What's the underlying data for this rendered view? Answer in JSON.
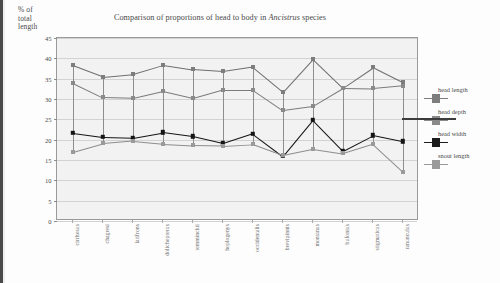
{
  "axis_label": {
    "line1": "% of",
    "line2": "total",
    "line3": "length"
  },
  "chart_data": {
    "type": "line",
    "title": "Comparison of proportions of head to body in Ancistrus species",
    "title_plain": "Comparison of proportions of head to body in ",
    "title_italic": "Ancistrus",
    "title_tail": " species",
    "xlabel": "",
    "ylabel": "% of total length",
    "ylim": [
      0,
      45
    ],
    "yticks": [
      0,
      5,
      10,
      15,
      20,
      25,
      30,
      35,
      40,
      45
    ],
    "grid": true,
    "legend_position": "right",
    "categories": [
      "cirrhosus",
      "chagresi",
      "latifrons",
      "dolichopterus",
      "temminckii",
      "hoplogenys",
      "occidentalis",
      "brevipinnis",
      "montanus",
      "bufonius",
      "stigmaticus",
      "ranunculus"
    ],
    "series": [
      {
        "name": "head length",
        "color": "#7d7d7d",
        "values": [
          38.3,
          35.5,
          36.2,
          38.4,
          37.3,
          36.8,
          37.9,
          31.8,
          39.9,
          32.8,
          37.8,
          34.1
        ]
      },
      {
        "name": "head depth",
        "color": "#8a8a8a",
        "values": [
          34.0,
          30.4,
          30.2,
          31.9,
          30.2,
          32.3,
          32.3,
          27.3,
          28.3,
          32.7,
          32.6,
          33.3
        ]
      },
      {
        "name": "head width",
        "color": "#141414",
        "values": [
          21.7,
          20.7,
          20.5,
          21.8,
          20.8,
          19.1,
          21.5,
          16.0,
          24.9,
          17.3,
          21.1,
          19.6
        ]
      },
      {
        "name": "snout length",
        "color": "#9a9a9a",
        "values": [
          17.0,
          19.1,
          19.7,
          19.0,
          18.6,
          18.5,
          18.9,
          16.2,
          17.7,
          16.6,
          18.9,
          12.1
        ]
      }
    ]
  }
}
